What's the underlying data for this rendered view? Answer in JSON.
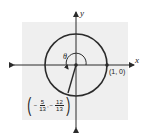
{
  "diagram": {
    "type": "unit-circle",
    "axes": {
      "x_label": "x",
      "y_label": "y"
    },
    "angle_label": "θ",
    "points": [
      {
        "name": "start",
        "label": "(1, 0)",
        "x": 1,
        "y": 0
      },
      {
        "name": "terminal",
        "x_num": "5",
        "x_den": "13",
        "x_sign": "−",
        "y_num": "12",
        "y_den": "13",
        "y_sign": "−",
        "comma": ","
      }
    ],
    "colors": {
      "circle": "#2b2b2b",
      "axes": "#2b2b2b",
      "panel": "#efefef"
    }
  }
}
